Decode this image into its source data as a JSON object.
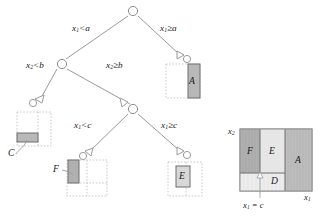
{
  "figure": {
    "type": "decision-tree-with-feature-space-partition",
    "background_color": "#ffffff",
    "line_color": "#9a9a9a",
    "text_color": "#1a1a1a",
    "shade_dark": "#b0b0b0",
    "shade_light": "#dcdcdc",
    "shade_pale": "#ebebeb",
    "dashed_color": "#c4c4c4"
  },
  "tree": {
    "nodes": [
      {
        "id": "root",
        "label": "",
        "cx": 133,
        "cy": 11
      },
      {
        "id": "n-left",
        "label": "",
        "cx": 62,
        "cy": 64
      },
      {
        "id": "n-mid",
        "label": "",
        "cx": 133,
        "cy": 109
      }
    ],
    "arrow_nodes": [
      {
        "id": "arrow-right-a",
        "cx": 182,
        "cy": 59
      },
      {
        "id": "arrow-left-b",
        "cx": 39,
        "cy": 102
      },
      {
        "id": "arrow-left-c",
        "cx": 88,
        "cy": 155
      },
      {
        "id": "arrow-right-c",
        "cx": 182,
        "cy": 155
      }
    ],
    "splits": [
      {
        "id": "split-x1-lt-a",
        "var": "x",
        "sub": "1",
        "op": "<",
        "value": "a",
        "x": 72,
        "y": 24
      },
      {
        "id": "split-x1-ge-a",
        "var": "x",
        "sub": "1",
        "op": "≥",
        "value": "a",
        "x": 160,
        "y": 24
      },
      {
        "id": "split-x2-lt-b",
        "var": "x",
        "sub": "2",
        "op": "<",
        "value": "b",
        "x": 26,
        "y": 61
      },
      {
        "id": "split-x2-ge-b",
        "var": "x",
        "sub": "2",
        "op": "≥",
        "value": "b",
        "x": 106,
        "y": 61
      },
      {
        "id": "split-x1-lt-c",
        "var": "x",
        "sub": "1",
        "op": "<",
        "value": "c",
        "x": 74,
        "y": 121
      },
      {
        "id": "split-x1-ge-c",
        "var": "x",
        "sub": "1",
        "op": "≥",
        "value": "c",
        "x": 161,
        "y": 121
      }
    ],
    "leaves": [
      {
        "id": "leaf-A",
        "label": "A",
        "label_position": "inside",
        "x": 189,
        "y": 80
      },
      {
        "id": "leaf-C",
        "label": "C",
        "label_position": "callout",
        "x": 8,
        "y": 147
      },
      {
        "id": "leaf-F",
        "label": "F",
        "label_position": "callout",
        "x": 53,
        "y": 166
      },
      {
        "id": "leaf-E",
        "label": "E",
        "label_position": "inside",
        "x": 180,
        "y": 176
      }
    ]
  },
  "partition": {
    "axis_y": {
      "var": "x",
      "sub": "2",
      "x": 228,
      "y": 127
    },
    "axis_x": {
      "var": "x",
      "sub": "1",
      "x": 306,
      "y": 196
    },
    "annotation": {
      "text_var": "x",
      "text_sub": "1",
      "text_rest": " = c",
      "x": 246,
      "y": 205
    },
    "regions": [
      {
        "id": "region-F",
        "label": "F",
        "x": 253,
        "y": 152,
        "fill": "#b0b0b0"
      },
      {
        "id": "region-E",
        "label": "E",
        "x": 272,
        "y": 152,
        "fill": "#e4e4e4"
      },
      {
        "id": "region-A",
        "label": "A",
        "x": 299,
        "y": 160,
        "fill": "#bdbdbd"
      },
      {
        "id": "region-D",
        "label": "D",
        "x": 275,
        "y": 184,
        "fill": "#ececec"
      }
    ]
  }
}
